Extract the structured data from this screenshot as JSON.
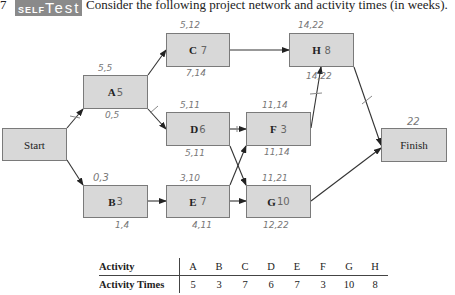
{
  "header": {
    "number": "7",
    "badge_part1": "SELF",
    "badge_part2": "Test",
    "prompt": "Consider the following project network and activity times (in weeks)."
  },
  "nodes": {
    "start": {
      "label": "Start"
    },
    "finish": {
      "label": "Finish",
      "annotation": "22"
    },
    "A": {
      "label": "A",
      "duration": "5",
      "top": "5,5",
      "bottom": "0,5"
    },
    "B": {
      "label": "B",
      "duration": "3",
      "top": "0,3",
      "bottom": "1,4"
    },
    "C": {
      "label": "C",
      "duration": "7",
      "top": "5,12",
      "bottom": "7,14"
    },
    "D": {
      "label": "D",
      "duration": "6",
      "top": "5,11",
      "bottom": "5,11"
    },
    "E": {
      "label": "E",
      "duration": "7",
      "top": "3,10",
      "bottom": "4,11"
    },
    "F": {
      "label": "F",
      "duration": "3",
      "top": "11,14",
      "bottom": "11,14"
    },
    "G": {
      "label": "G",
      "duration": "10",
      "top": "11,21",
      "bottom": "12,22"
    },
    "H": {
      "label": "H",
      "duration": "8",
      "top": "14,22",
      "bottom": "14,22"
    }
  },
  "edges": [
    {
      "from": "Start",
      "to": "A",
      "critical_mark": true
    },
    {
      "from": "Start",
      "to": "B",
      "critical_mark": false
    },
    {
      "from": "A",
      "to": "C",
      "critical_mark": false
    },
    {
      "from": "A",
      "to": "D",
      "critical_mark": true
    },
    {
      "from": "B",
      "to": "E",
      "critical_mark": false
    },
    {
      "from": "C",
      "to": "H",
      "critical_mark": false
    },
    {
      "from": "D",
      "to": "F",
      "critical_mark": true
    },
    {
      "from": "D",
      "to": "G",
      "critical_mark": false
    },
    {
      "from": "E",
      "to": "F",
      "critical_mark": false
    },
    {
      "from": "E",
      "to": "G",
      "critical_mark": false
    },
    {
      "from": "F",
      "to": "H",
      "critical_mark": true
    },
    {
      "from": "H",
      "to": "Finish",
      "critical_mark": true
    },
    {
      "from": "G",
      "to": "Finish",
      "critical_mark": false
    }
  ],
  "table": {
    "row1_label": "Activity",
    "row2_label": "Activity Times",
    "activities": [
      "A",
      "B",
      "C",
      "D",
      "E",
      "F",
      "G",
      "H"
    ],
    "times": [
      "5",
      "3",
      "7",
      "6",
      "7",
      "3",
      "10",
      "8"
    ]
  }
}
